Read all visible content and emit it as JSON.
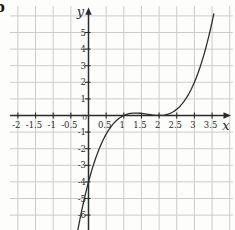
{
  "figure": {
    "part_label": "b"
  },
  "colors": {
    "background": "#fdfdfb",
    "grid": "#cbcbcb",
    "axis": "#2b2b2b",
    "curve": "#2f2f2f",
    "text": "#2b2b2b"
  },
  "chart_data": {
    "type": "line",
    "title": "",
    "xlabel": "x",
    "ylabel": "y",
    "origin_label": "0",
    "xlim": [
      -2.3,
      4.1
    ],
    "ylim": [
      -6.9,
      6.5
    ],
    "grid": true,
    "x_gridlines": [
      -2,
      -1.5,
      -1,
      -0.5,
      0,
      0.5,
      1,
      1.5,
      2,
      2.5,
      3,
      3.5,
      4
    ],
    "y_gridlines": [
      -6,
      -5,
      -4,
      -3,
      -2,
      -1,
      0,
      1,
      2,
      3,
      4,
      5,
      6
    ],
    "x_tick_values": [
      -2,
      -1.5,
      -1,
      -0.5,
      0.5,
      1,
      1.5,
      2,
      2.5,
      3,
      3.5
    ],
    "x_tick_labels": [
      "-2",
      "-1.5",
      "-1",
      "-0.5",
      "0.5",
      "1",
      "1.5",
      "2",
      "2.5",
      "3",
      "3.5"
    ],
    "y_tick_values": [
      5,
      4,
      3,
      2,
      1,
      -1,
      -2,
      -3,
      -4,
      -5,
      -6
    ],
    "y_tick_labels": [
      "5",
      "4",
      "3",
      "2",
      "1",
      "-1",
      "-2",
      "-3",
      "-4",
      "-5",
      "-6"
    ],
    "series": [
      {
        "name": "cubic-curve",
        "points": [
          [
            -0.3,
            -6.877
          ],
          [
            -0.25,
            -6.328
          ],
          [
            -0.2,
            -5.808
          ],
          [
            -0.15,
            -5.316
          ],
          [
            -0.1,
            -4.851
          ],
          [
            -0.05,
            -4.413
          ],
          [
            0,
            -4
          ],
          [
            0.05,
            -3.612
          ],
          [
            0.1,
            -3.249
          ],
          [
            0.15,
            -2.909
          ],
          [
            0.2,
            -2.592
          ],
          [
            0.25,
            -2.297
          ],
          [
            0.3,
            -2.023
          ],
          [
            0.35,
            -1.77
          ],
          [
            0.4,
            -1.536
          ],
          [
            0.45,
            -1.321
          ],
          [
            0.5,
            -1.125
          ],
          [
            0.55,
            -0.946
          ],
          [
            0.6,
            -0.784
          ],
          [
            0.65,
            -0.638
          ],
          [
            0.7,
            -0.507
          ],
          [
            0.75,
            -0.391
          ],
          [
            0.8,
            -0.288
          ],
          [
            0.85,
            -0.198
          ],
          [
            0.9,
            -0.121
          ],
          [
            0.95,
            -0.055
          ],
          [
            1,
            0
          ],
          [
            1.05,
            0.045
          ],
          [
            1.1,
            0.081
          ],
          [
            1.15,
            0.108
          ],
          [
            1.2,
            0.128
          ],
          [
            1.25,
            0.141
          ],
          [
            1.3,
            0.147
          ],
          [
            1.35,
            0.148
          ],
          [
            1.4,
            0.144
          ],
          [
            1.45,
            0.136
          ],
          [
            1.5,
            0.125
          ],
          [
            1.55,
            0.111
          ],
          [
            1.6,
            0.096
          ],
          [
            1.65,
            0.08
          ],
          [
            1.7,
            0.063
          ],
          [
            1.75,
            0.047
          ],
          [
            1.8,
            0.032
          ],
          [
            1.85,
            0.019
          ],
          [
            1.9,
            0.009
          ],
          [
            1.95,
            0.002
          ],
          [
            2,
            0
          ],
          [
            2.05,
            0.003
          ],
          [
            2.1,
            0.011
          ],
          [
            2.15,
            0.026
          ],
          [
            2.2,
            0.048
          ],
          [
            2.25,
            0.078
          ],
          [
            2.3,
            0.117
          ],
          [
            2.35,
            0.165
          ],
          [
            2.4,
            0.224
          ],
          [
            2.45,
            0.294
          ],
          [
            2.5,
            0.375
          ],
          [
            2.55,
            0.469
          ],
          [
            2.6,
            0.576
          ],
          [
            2.65,
            0.697
          ],
          [
            2.7,
            0.833
          ],
          [
            2.75,
            0.984
          ],
          [
            2.8,
            1.152
          ],
          [
            2.85,
            1.337
          ],
          [
            2.9,
            1.539
          ],
          [
            2.95,
            1.76
          ],
          [
            3,
            2
          ],
          [
            3.05,
            2.26
          ],
          [
            3.1,
            2.541
          ],
          [
            3.15,
            2.843
          ],
          [
            3.2,
            3.168
          ],
          [
            3.25,
            3.516
          ],
          [
            3.3,
            3.887
          ],
          [
            3.35,
            4.283
          ],
          [
            3.4,
            4.704
          ],
          [
            3.45,
            5.151
          ],
          [
            3.5,
            5.625
          ],
          [
            3.55,
            6.126
          ]
        ]
      }
    ]
  }
}
